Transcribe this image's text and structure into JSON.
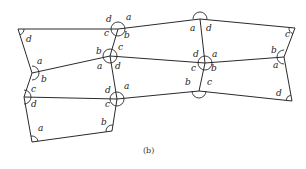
{
  "caption": "(b)",
  "vertices": {
    "V1": [
      18,
      29
    ],
    "V2": [
      118,
      29
    ],
    "V3": [
      200,
      19
    ],
    "V4": [
      295,
      28
    ],
    "V5": [
      32,
      73
    ],
    "V6": [
      110,
      56
    ],
    "V7": [
      205,
      63
    ],
    "V8": [
      284,
      57
    ],
    "V9": [
      24,
      97
    ],
    "V10": [
      117,
      99
    ],
    "V11": [
      199,
      91
    ],
    "V12": [
      292,
      101
    ],
    "V13": [
      32,
      142
    ],
    "V14": [
      112,
      131
    ]
  },
  "edges": [
    [
      "V1",
      "V2"
    ],
    [
      "V2",
      "V3"
    ],
    [
      "V3",
      "V4"
    ],
    [
      "V1",
      "V5"
    ],
    [
      "V5",
      "V9"
    ],
    [
      "V9",
      "V13"
    ],
    [
      "V13",
      "V14"
    ],
    [
      "V14",
      "V10"
    ],
    [
      "V10",
      "V6"
    ],
    [
      "V6",
      "V2"
    ],
    [
      "V5",
      "V6"
    ],
    [
      "V6",
      "V7"
    ],
    [
      "V7",
      "V8"
    ],
    [
      "V9",
      "V10"
    ],
    [
      "V10",
      "V11"
    ],
    [
      "V11",
      "V12"
    ],
    [
      "V3",
      "V7"
    ],
    [
      "V7",
      "V11"
    ],
    [
      "V4",
      "V8"
    ],
    [
      "V8",
      "V12"
    ]
  ],
  "angle_labels": [
    {
      "t": "d",
      "x": 26,
      "y": 42
    },
    {
      "t": "d",
      "x": 106,
      "y": 22
    },
    {
      "t": "a",
      "x": 126,
      "y": 20
    },
    {
      "t": "c",
      "x": 104,
      "y": 36
    },
    {
      "t": "b",
      "x": 124,
      "y": 38
    },
    {
      "t": "a",
      "x": 190,
      "y": 31
    },
    {
      "t": "d",
      "x": 206,
      "y": 31
    },
    {
      "t": "c",
      "x": 285,
      "y": 37
    },
    {
      "t": "a",
      "x": 37,
      "y": 64
    },
    {
      "t": "b",
      "x": 41,
      "y": 82
    },
    {
      "t": "b",
      "x": 96,
      "y": 54
    },
    {
      "t": "c",
      "x": 118,
      "y": 50
    },
    {
      "t": "a",
      "x": 97,
      "y": 69
    },
    {
      "t": "d",
      "x": 115,
      "y": 69
    },
    {
      "t": "d",
      "x": 193,
      "y": 57
    },
    {
      "t": "a",
      "x": 212,
      "y": 57
    },
    {
      "t": "c",
      "x": 191,
      "y": 71
    },
    {
      "t": "b",
      "x": 211,
      "y": 71
    },
    {
      "t": "b",
      "x": 271,
      "y": 53
    },
    {
      "t": "a",
      "x": 273,
      "y": 68
    },
    {
      "t": "c",
      "x": 31,
      "y": 92
    },
    {
      "t": "d",
      "x": 31,
      "y": 107
    },
    {
      "t": "d",
      "x": 105,
      "y": 93
    },
    {
      "t": "a",
      "x": 124,
      "y": 89
    },
    {
      "t": "c",
      "x": 105,
      "y": 107
    },
    {
      "t": "b",
      "x": 185,
      "y": 85
    },
    {
      "t": "c",
      "x": 207,
      "y": 85
    },
    {
      "t": "d",
      "x": 276,
      "y": 96
    },
    {
      "t": "a",
      "x": 38,
      "y": 131
    },
    {
      "t": "b",
      "x": 101,
      "y": 125
    }
  ],
  "full_circles": [
    "V2",
    "V6",
    "V7",
    "V10"
  ],
  "semicircles": [
    {
      "v": "V3",
      "dir": "down"
    },
    {
      "v": "V11",
      "dir": "up"
    },
    {
      "v": "V5",
      "dir": "right"
    },
    {
      "v": "V9",
      "dir": "right"
    },
    {
      "v": "V8",
      "dir": "left"
    }
  ],
  "corner_arcs": [
    {
      "v": "V1",
      "from": [
        "V2"
      ],
      "to": [
        "V5"
      ]
    },
    {
      "v": "V4",
      "from": [
        "V3"
      ],
      "to": [
        "V8"
      ]
    },
    {
      "v": "V12",
      "from": [
        "V8"
      ],
      "to": [
        "V11"
      ]
    },
    {
      "v": "V13",
      "from": [
        "V9"
      ],
      "to": [
        "V14"
      ]
    },
    {
      "v": "V14",
      "from": [
        "V13"
      ],
      "to": [
        "V10"
      ]
    }
  ]
}
